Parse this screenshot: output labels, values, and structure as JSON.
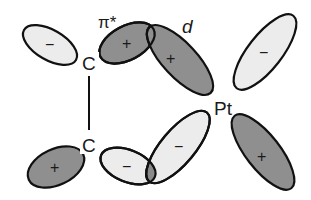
{
  "diagram": {
    "type": "orbital-interaction",
    "colors": {
      "positive_fill": "#8f8f8f",
      "negative_fill": "#ececec",
      "stroke": "#111111",
      "overlap_fill": "#8a8a8a"
    },
    "atoms": [
      {
        "id": "c_top",
        "label": "C"
      },
      {
        "id": "c_bottom",
        "label": "C"
      },
      {
        "id": "pt",
        "label": "Pt"
      }
    ],
    "bond": {
      "from": "c_top",
      "to": "c_bottom"
    },
    "orbital_labels": {
      "pi_star": "π*",
      "d": "d"
    },
    "lobes": [
      {
        "name": "c-top-left-lobe",
        "sign": "−"
      },
      {
        "name": "c-top-right-lobe",
        "sign": "+"
      },
      {
        "name": "pt-upper-left-lobe",
        "sign": "+"
      },
      {
        "name": "pt-upper-right-lobe",
        "sign": "−"
      },
      {
        "name": "pt-lower-left-lobe",
        "sign": "−"
      },
      {
        "name": "pt-lower-right-lobe",
        "sign": "+"
      },
      {
        "name": "c-bottom-left-lobe",
        "sign": "+"
      },
      {
        "name": "c-bottom-right-lobe",
        "sign": "−"
      }
    ]
  }
}
